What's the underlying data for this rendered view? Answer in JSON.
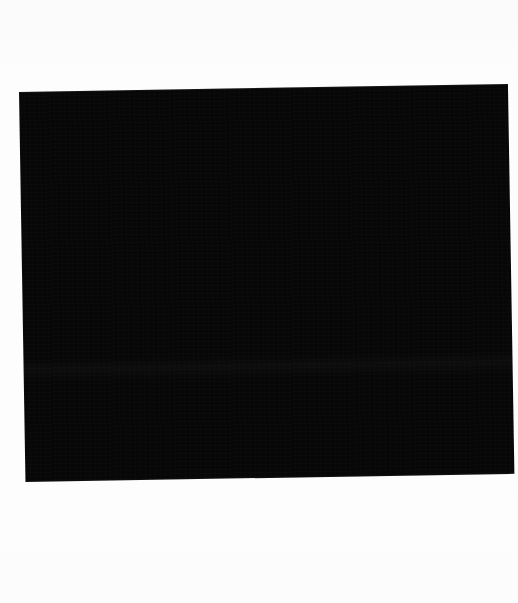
{
  "page": {
    "background_color": "#fdfdfd",
    "width": 518,
    "height": 603,
    "description": "Scanned page containing a single large solid black rectangle on a blank white background"
  },
  "black_plate": {
    "fill_color": "#070707",
    "rotation_degrees": -0.95,
    "left": 19,
    "top": 92,
    "width": 489,
    "height": 390,
    "label": "",
    "content_text": ""
  },
  "margins": {
    "top_label": "",
    "bottom_label": "",
    "left_label": "",
    "right_label": ""
  },
  "artifacts": {
    "scanner_band_label": "",
    "noise_label": ""
  }
}
